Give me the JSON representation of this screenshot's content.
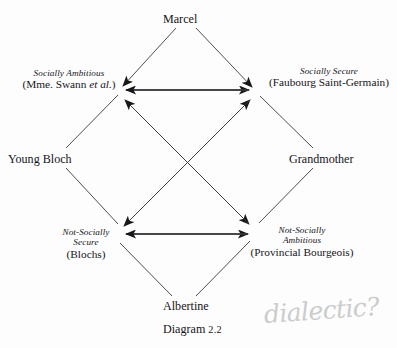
{
  "figure": {
    "caption_title": "Diagram",
    "caption_number": "2.2",
    "background_color": "#fdfdfd",
    "line_color": "#3a3a3f"
  },
  "nodes": {
    "top": {
      "label": "Marcel"
    },
    "left_outer": {
      "label": "Young Bloch"
    },
    "right_outer": {
      "label": "Grandmother"
    },
    "bottom": {
      "label": "Albertine"
    },
    "upper_left": {
      "italic_line": "Socially Ambitious",
      "paren_line_pre": "(Mme. Swann ",
      "paren_line_italic": "et al.",
      "paren_line_post": ")"
    },
    "upper_right": {
      "italic_line": "Socially Secure",
      "paren_line": "(Faubourg Saint-Germain)"
    },
    "lower_left": {
      "italic_line_1": "Not-Socially",
      "italic_line_2": "Secure",
      "paren_line": "(Blochs)"
    },
    "lower_right": {
      "italic_line_1": "Not-Socially",
      "italic_line_2": "Ambitious",
      "paren_line": "(Provincial Bourgeois)"
    }
  },
  "annotations": {
    "handwritten_note": "dialectic?",
    "handwritten_color": "#c9cacc"
  }
}
